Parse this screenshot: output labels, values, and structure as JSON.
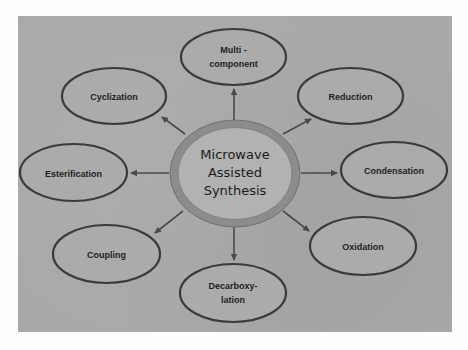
{
  "diagram": {
    "type": "hub-and-spoke",
    "center": {
      "label_lines": [
        "Microwave",
        "Assisted",
        "Synthesis"
      ]
    },
    "nodes": [
      {
        "id": "multicomponent",
        "label_lines": [
          "Multi -",
          "component"
        ],
        "position": "top"
      },
      {
        "id": "reduction",
        "label_lines": [
          "Reduction"
        ],
        "position": "top-right"
      },
      {
        "id": "condensation",
        "label_lines": [
          "Condensation"
        ],
        "position": "right"
      },
      {
        "id": "oxidation",
        "label_lines": [
          "Oxidation"
        ],
        "position": "bottom-right"
      },
      {
        "id": "decarboxylation",
        "label_lines": [
          "Decarboxy-",
          "lation"
        ],
        "position": "bottom"
      },
      {
        "id": "coupling",
        "label_lines": [
          "Coupling"
        ],
        "position": "bottom-left"
      },
      {
        "id": "esterification",
        "label_lines": [
          "Esterification"
        ],
        "position": "left"
      },
      {
        "id": "cyclization",
        "label_lines": [
          "Cyclization"
        ],
        "position": "top-left"
      }
    ],
    "edges": [
      {
        "from": "center",
        "to": "multicomponent"
      },
      {
        "from": "center",
        "to": "reduction"
      },
      {
        "from": "center",
        "to": "condensation"
      },
      {
        "from": "center",
        "to": "oxidation"
      },
      {
        "from": "center",
        "to": "decarboxylation"
      },
      {
        "from": "center",
        "to": "coupling"
      },
      {
        "from": "center",
        "to": "esterification"
      },
      {
        "from": "center",
        "to": "cyclization"
      }
    ],
    "colors": {
      "panel_background": "#a9a9a9",
      "node_fill": "#ababab",
      "node_stroke": "#3a3a3a",
      "center_ring": "#8c8c8c",
      "center_fill": "#b2b2b2",
      "arrow": "#4a4a4a",
      "text": "#1e1e1e"
    }
  }
}
